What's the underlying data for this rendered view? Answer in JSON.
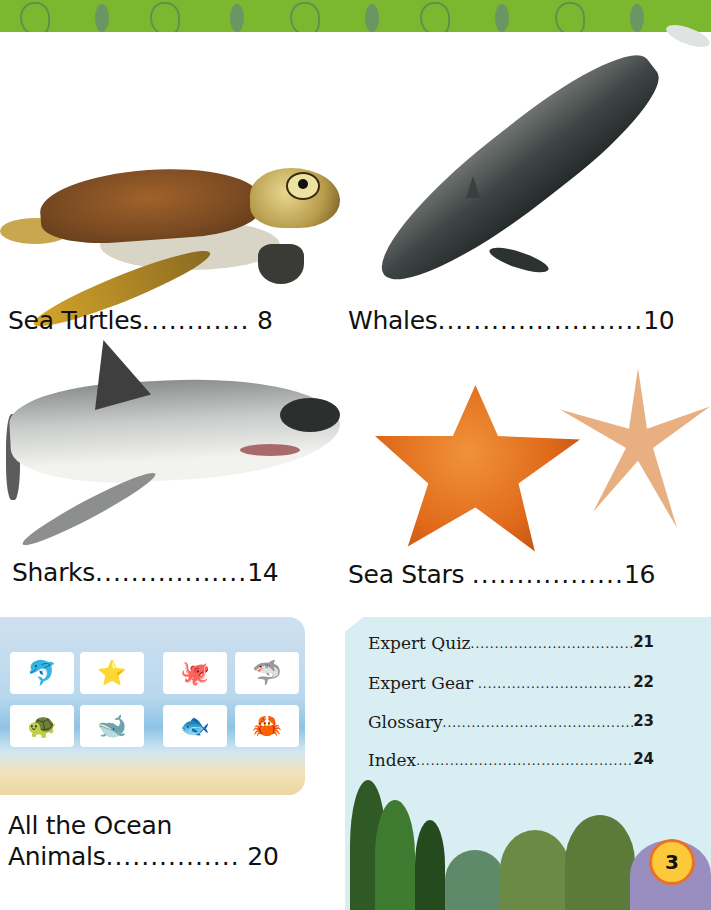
{
  "banner": {
    "pattern": "green-sea-life-pattern",
    "color": "#7cb82f"
  },
  "entries": [
    {
      "title": "Sea Turtles",
      "dots": "............",
      "page": "8",
      "image": "sea-turtle"
    },
    {
      "title": "Whales",
      "dots": ".......................",
      "page": "10",
      "image": "whale"
    },
    {
      "title": "Sharks",
      "dots": ".................",
      "page": "14",
      "image": "great-white-shark"
    },
    {
      "title": "Sea Stars",
      "dots": ".................",
      "page": "16",
      "image": "sea-stars"
    },
    {
      "title_line1": "All the Ocean",
      "title_line2": "Animals",
      "dots": "...............",
      "page": "20",
      "image": "ocean-animals-collage"
    }
  ],
  "ocean_panel": {
    "cards": [
      "🐬",
      "⭐",
      "🐙",
      "🦈",
      "🐢",
      "🐋",
      "🐟",
      "🦀"
    ]
  },
  "back_matter": [
    {
      "title": "Expert Quiz",
      "page": "21"
    },
    {
      "title": "Expert Gear",
      "page": "22"
    },
    {
      "title": "Glossary",
      "page": "23"
    },
    {
      "title": "Index",
      "page": "24"
    }
  ],
  "page_number": "3",
  "colors": {
    "badge_fill": "#fbc93a",
    "badge_border": "#e8712a",
    "back_panel": "#d9eef3"
  }
}
